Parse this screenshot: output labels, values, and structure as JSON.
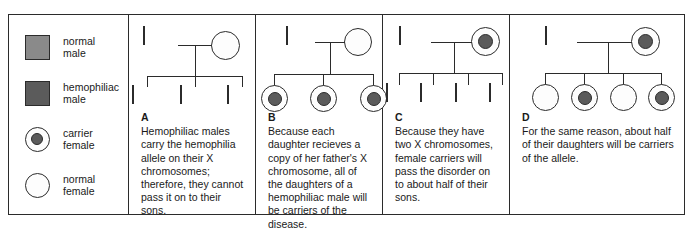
{
  "legend": {
    "items": [
      {
        "symbol": "square-gray",
        "label": "normal\nmale"
      },
      {
        "symbol": "square-dark",
        "label": "hemophiliac\nmale"
      },
      {
        "symbol": "circle-dot",
        "label": "carrier\nfemale"
      },
      {
        "symbol": "circle-open",
        "label": "normal\nfemale"
      }
    ]
  },
  "colors": {
    "normal_male_fill": "#8a8a8a",
    "affected_male_fill": "#5b5b5b",
    "carrier_dot_fill": "#5b5b5b",
    "normal_female_fill": "#fdfdfd",
    "outline": "#2b2b2b"
  },
  "panels": [
    {
      "letter": "A",
      "caption": "Hemophiliac males carry the hemophilia allele on their X chromosomes; therefore, they cannot pass it on to their sons.",
      "parents": {
        "father": "affected-male",
        "mother": "normal-female"
      },
      "children": [
        "normal-male",
        "normal-male",
        "normal-male"
      ]
    },
    {
      "letter": "B",
      "caption": "Because each daughter recieves a copy of her father's X chromosome, all of the daughters of a hemophiliac male will be carriers of the disease.",
      "parents": {
        "father": "affected-male",
        "mother": "normal-female"
      },
      "children": [
        "carrier-female",
        "carrier-female",
        "carrier-female"
      ]
    },
    {
      "letter": "C",
      "caption": "Because they have two X chromosomes, female carriers will pass the disorder on to about half of their sons.",
      "parents": {
        "father": "normal-male",
        "mother": "carrier-female"
      },
      "children": [
        "normal-male",
        "affected-male",
        "affected-male",
        "affected-male"
      ]
    },
    {
      "letter": "D",
      "caption": "For the same reason, about half of their daughters will be carriers of the allele.",
      "parents": {
        "father": "normal-male",
        "mother": "carrier-female"
      },
      "children": [
        "normal-female",
        "carrier-female",
        "normal-female",
        "carrier-female"
      ]
    }
  ]
}
